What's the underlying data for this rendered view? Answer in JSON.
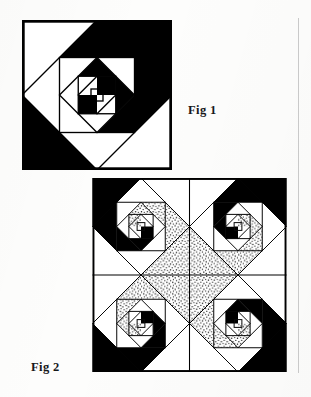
{
  "page": {
    "background_color": "#fdfdfc",
    "ink_color": "#000000",
    "width": 311,
    "height": 397
  },
  "figures": [
    {
      "id": "fig1",
      "label": "Fig 1",
      "caption_position": "right-of-figure",
      "description": "Single whirling-squares (logarithmic spiral) quilt block made of nested rotated squares, each ring split into black and white triangles forming a pinwheel spiral.",
      "block_count": 1,
      "fills_used": [
        "black",
        "white"
      ],
      "nesting_levels": 6,
      "rotation_per_level_degrees": 45,
      "scale_per_level": 0.707,
      "frame": {
        "x": 22,
        "y": 20,
        "width": 150,
        "height": 150,
        "stroke": "#000000",
        "stroke_width": 2
      }
    },
    {
      "id": "fig2",
      "label": "Fig 2",
      "caption_position": "left-of-figure",
      "description": "Four whirling-squares blocks arranged two-by-two, each rotated ninety degrees from its neighbour, with a third stippled value added so the spirals read as a rotating pinwheel across the set.",
      "block_count": 4,
      "grid": {
        "rows": 2,
        "columns": 2
      },
      "fills_used": [
        "black",
        "white",
        "stipple"
      ],
      "nesting_levels": 6,
      "rotation_per_level_degrees": 45,
      "scale_per_level": 0.707,
      "quadrants": [
        {
          "name": "top-left",
          "block_rotation_degrees": 0
        },
        {
          "name": "top-right",
          "block_rotation_degrees": 90
        },
        {
          "name": "bottom-right",
          "block_rotation_degrees": 180
        },
        {
          "name": "bottom-left",
          "block_rotation_degrees": 270
        }
      ],
      "frame": {
        "x": 92,
        "y": 178,
        "width": 195,
        "height": 194,
        "stroke": "#000000",
        "stroke_width": 2
      }
    }
  ],
  "margin_rule": {
    "visible": true,
    "color": "#c9c9c9",
    "x": 298,
    "top": 18,
    "height": 355
  },
  "colors": {
    "ink": "#000000",
    "paper": "#fdfdfc",
    "rule": "#c9c9c9",
    "stipple_dot": "#111111"
  }
}
